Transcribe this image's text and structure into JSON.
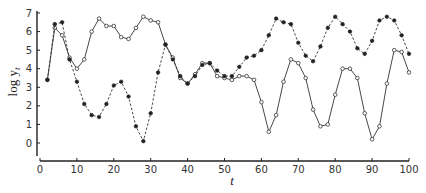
{
  "chart_data": {
    "type": "line",
    "title": "",
    "xlabel": "t",
    "ylabel": "log y_t",
    "xlim": [
      0,
      100
    ],
    "ylim": [
      -0.7,
      7
    ],
    "xticks": [
      0,
      10,
      20,
      30,
      40,
      50,
      60,
      70,
      80,
      90,
      100
    ],
    "yticks": [
      0,
      1,
      2,
      3,
      4,
      5,
      6,
      7
    ],
    "grid": false,
    "legend": null,
    "x": [
      2,
      4,
      6,
      8,
      10,
      12,
      14,
      16,
      18,
      20,
      22,
      24,
      26,
      28,
      30,
      32,
      34,
      36,
      38,
      40,
      42,
      44,
      46,
      48,
      50,
      52,
      54,
      56,
      58,
      60,
      62,
      64,
      66,
      68,
      70,
      72,
      74,
      76,
      78,
      80,
      82,
      84,
      86,
      88,
      90,
      92,
      94,
      96,
      98,
      100
    ],
    "series": [
      {
        "name": "filled markers (dashed)",
        "marker": "filled-circle",
        "linestyle": "dashed",
        "values": [
          3.4,
          6.4,
          6.5,
          4.5,
          3.3,
          2.1,
          1.5,
          1.4,
          2.1,
          3.1,
          3.3,
          2.5,
          0.9,
          0.1,
          1.6,
          3.8,
          5.3,
          4.5,
          3.6,
          3.2,
          3.6,
          4.2,
          4.3,
          3.9,
          3.6,
          3.6,
          4.1,
          4.6,
          4.7,
          5.0,
          5.8,
          6.7,
          6.5,
          6.4,
          5.4,
          4.7,
          4.4,
          5.2,
          6.2,
          6.8,
          6.4,
          6.0,
          5.1,
          4.8,
          5.5,
          6.6,
          6.8,
          6.6,
          5.8,
          4.8
        ]
      },
      {
        "name": "open markers (solid)",
        "marker": "open-circle",
        "linestyle": "solid",
        "values": [
          3.4,
          6.2,
          5.8,
          4.6,
          4.0,
          4.5,
          6.0,
          6.7,
          6.3,
          6.3,
          5.7,
          5.6,
          6.2,
          6.8,
          6.6,
          6.5,
          5.3,
          4.6,
          3.5,
          3.2,
          3.7,
          4.3,
          4.3,
          3.6,
          3.5,
          3.4,
          3.6,
          3.6,
          3.4,
          2.2,
          0.6,
          1.5,
          3.3,
          4.5,
          4.3,
          3.5,
          1.8,
          0.9,
          1.0,
          2.6,
          4.0,
          4.0,
          3.5,
          1.6,
          0.2,
          0.9,
          3.2,
          5.0,
          4.9,
          3.8
        ]
      }
    ]
  },
  "labels": {
    "xlabel": "t",
    "ylabel_main": "log y",
    "ylabel_sub": "t"
  }
}
